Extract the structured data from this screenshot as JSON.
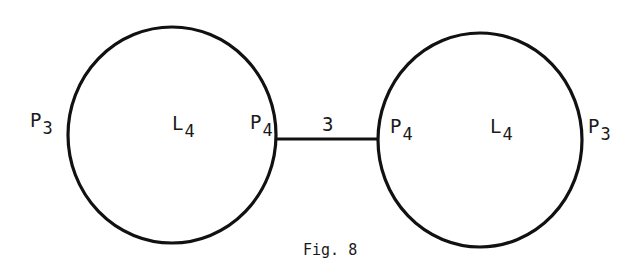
{
  "figure": {
    "caption": "Fig. 8",
    "stroke_color": "#111111",
    "background": "#ffffff"
  },
  "left_loop": {
    "outer_label": {
      "main": "P",
      "sub": "3"
    },
    "center_label": {
      "main": "L",
      "sub": "4"
    },
    "inner_label": {
      "main": "P",
      "sub": "4"
    }
  },
  "right_loop": {
    "inner_label": {
      "main": "P",
      "sub": "4"
    },
    "center_label": {
      "main": "L",
      "sub": "4"
    },
    "outer_label": {
      "main": "P",
      "sub": "3"
    }
  },
  "connector": {
    "label": "3"
  }
}
